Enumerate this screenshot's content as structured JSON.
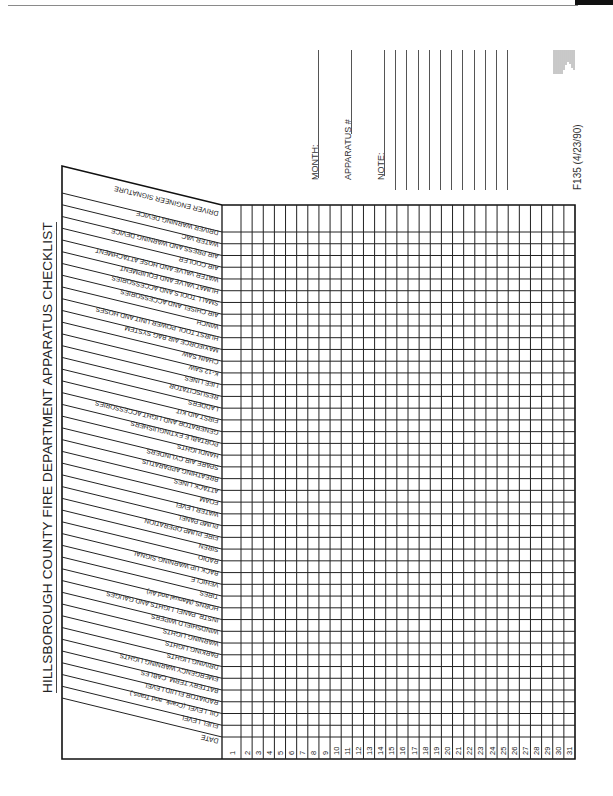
{
  "title": "HILLSBOROUGH COUNTY FIRE DEPARTMENT APPARATUS CHECKLIST",
  "header_rows": {
    "signature": "DRIVER ENGINEER SIGNATURE",
    "date": "DATE"
  },
  "check_items": [
    "DRIVER ENGINEER SIGNATURE",
    "DRIVER WARNING DEVICE",
    "WATER VAC",
    "AIR PRESS AND WARNING DEVICE",
    "AIR COOLER",
    "WATER VALVE AND HOSE ATTACHMENT",
    "HUMAT VALVE AND EQUIPMENT",
    "SMALL TOOLS AND ACCESSORIES",
    "AIR CHISEL AND ACCESSORIES",
    "WINCH",
    "HURST TOOL POWER UNIT AND HOSES",
    "MAXIFORCE AIR BAG SYSTEM",
    "CHAIN SAW",
    "K-12 SAW",
    "LIFE LINES",
    "RESUSCITATOR",
    "LADDERS",
    "FIRST AID KIT",
    "GENERATOR AND LIGHT ACCESSORIES",
    "PORTABLE EXTINGUISHERS",
    "HANDLIGHTS",
    "SPARE AIR CYLINDERS",
    "BREATHING APPARATUS",
    "ATTACK LINES",
    "FOAM",
    "WATER LEVEL",
    "PUMP PANEL",
    "FIRE PUMP OPERATION",
    "SIREN",
    "RADIO",
    "BACK UP WARNING SIGNAL",
    "VEHICLE",
    "TIRES",
    "HORNS (Manual and Air)",
    "INSTR. PANEL LIGHTS AND GAUGES",
    "WINDSHIELD WIPERS",
    "WARNING LIGHTS",
    "PARKING LIGHTS",
    "DRIVING LIGHTS",
    "EMERGENCY WARNING LIGHTS",
    "BATTERY TERM. CABLES",
    "RADIATOR FLUID LEVEL",
    "OIL LEVEL (Crank, and Trans.)",
    "FUEL LEVEL"
  ],
  "days": [
    "1",
    "2",
    "3",
    "4",
    "5",
    "6",
    "7",
    "8",
    "9",
    "10",
    "11",
    "12",
    "13",
    "14",
    "15",
    "16",
    "17",
    "18",
    "19",
    "20",
    "21",
    "22",
    "23",
    "24",
    "25",
    "26",
    "27",
    "28",
    "29",
    "30",
    "31"
  ],
  "fields": {
    "month_label": "MONTH:",
    "month_value": "",
    "apparatus_label": "APPARATUS #",
    "apparatus_value": "",
    "note_label": "NOTE:",
    "note_lines": [
      "",
      "",
      "",
      "",
      "",
      "",
      "",
      "",
      "",
      "",
      "",
      ""
    ]
  },
  "form_id": "F135 (4/23/90)"
}
